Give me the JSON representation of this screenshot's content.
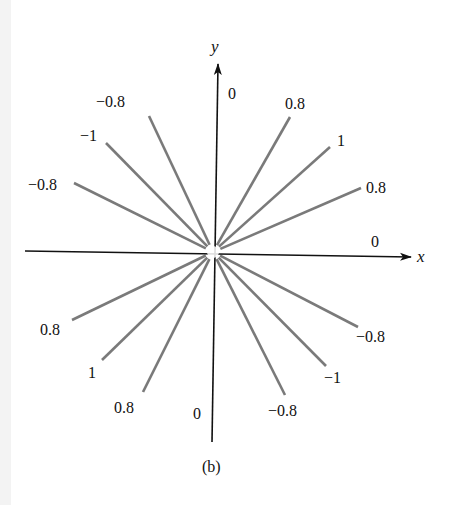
{
  "figure": {
    "caption": "(b)",
    "x_axis_label": "x",
    "y_axis_label": "y",
    "colors": {
      "axes": "#111111",
      "rays": "#7a7a7a",
      "text": "#111111",
      "left_strip": "#f3f3f3"
    },
    "center": [
      213,
      252
    ],
    "rays": [
      {
        "label": "0",
        "end": [
          375,
          252
        ],
        "label_pos": [
          371,
          247
        ],
        "on_axis": true
      },
      {
        "label": "0.8",
        "end": [
          361,
          188
        ],
        "label_pos": [
          366,
          193
        ]
      },
      {
        "label": "1",
        "end": [
          330,
          147
        ],
        "label_pos": [
          337,
          146
        ]
      },
      {
        "label": "0.8",
        "end": [
          290,
          117
        ],
        "label_pos": [
          285,
          109
        ]
      },
      {
        "label": "0",
        "end": [
          218,
          100
        ],
        "label_pos": [
          228,
          99
        ],
        "on_axis": true
      },
      {
        "label": "−0.8",
        "end": [
          149,
          116
        ],
        "label_pos": [
          96,
          107
        ]
      },
      {
        "label": "−1",
        "end": [
          106,
          143
        ],
        "label_pos": [
          80,
          141
        ]
      },
      {
        "label": "−0.8",
        "end": [
          74,
          183
        ],
        "label_pos": [
          28,
          190
        ]
      },
      {
        "label": "0.8",
        "end": [
          72,
          320
        ],
        "label_pos": [
          40,
          335
        ]
      },
      {
        "label": "1",
        "end": [
          102,
          360
        ],
        "label_pos": [
          88,
          378
        ]
      },
      {
        "label": "0.8",
        "end": [
          143,
          392
        ],
        "label_pos": [
          114,
          413
        ]
      },
      {
        "label": "0",
        "end": [
          212,
          415
        ],
        "label_pos": [
          193,
          419
        ],
        "on_axis": true
      },
      {
        "label": "−0.8",
        "end": [
          285,
          395
        ],
        "label_pos": [
          268,
          416
        ]
      },
      {
        "label": "−1",
        "end": [
          326,
          366
        ],
        "label_pos": [
          324,
          383
        ]
      },
      {
        "label": "−0.8",
        "end": [
          358,
          327
        ],
        "label_pos": [
          356,
          342
        ]
      }
    ]
  }
}
